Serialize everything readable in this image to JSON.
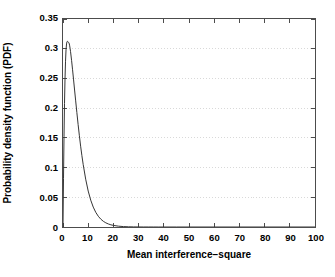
{
  "chart_data": {
    "type": "line",
    "title": "",
    "subtitle": "",
    "xlabel": "Mean interference−square",
    "ylabel": "Probability density function (PDF)",
    "xlim": [
      0,
      100
    ],
    "ylim": [
      0,
      0.35
    ],
    "xticks": [
      0,
      10,
      20,
      30,
      40,
      50,
      60,
      70,
      80,
      90,
      100
    ],
    "xtick_labels": [
      "0",
      "10",
      "20",
      "30",
      "40",
      "50",
      "60",
      "70",
      "80",
      "90",
      "100"
    ],
    "yticks": [
      0,
      0.05,
      0.1,
      0.15,
      0.2,
      0.25,
      0.3,
      0.35
    ],
    "ytick_labels": [
      "0",
      "0.05",
      "0.1",
      "0.15",
      "0.2",
      "0.25",
      "0.3",
      "0.35"
    ],
    "grid": {
      "horizontal": true,
      "vertical": false,
      "style": "dotted",
      "color": "#d9d9d9"
    },
    "legend": {
      "visible": false,
      "position": "none"
    },
    "box": true,
    "tick_direction": "in",
    "line_color": "#333333",
    "line_width": 1.0,
    "series": [
      {
        "name": "PDF of mean interference-square",
        "x": [
          0.0,
          0.2,
          0.4,
          0.6,
          0.8,
          1.0,
          1.2,
          1.4,
          1.6,
          1.8,
          2.0,
          2.2,
          2.3,
          2.4,
          2.6,
          2.8,
          3.0,
          3.4,
          3.8,
          4.2,
          4.6,
          5.0,
          5.5,
          6.0,
          6.5,
          7.0,
          7.5,
          8.0,
          9.0,
          10.0,
          11.0,
          12.0,
          13.0,
          14.0,
          15.0,
          16.0,
          17.0,
          18.0,
          19.0,
          20.0,
          22.0,
          24.0,
          26.0,
          28.0,
          30.0,
          32.0,
          34.0,
          36.0,
          38.0,
          40.0,
          45.0,
          50.0,
          60.0,
          70.0,
          80.0,
          90.0,
          100.0
        ],
        "y": [
          0.0,
          0.082,
          0.152,
          0.208,
          0.249,
          0.279,
          0.298,
          0.308,
          0.312,
          0.3125,
          0.3115,
          0.3105,
          0.3103,
          0.3095,
          0.306,
          0.301,
          0.295,
          0.2805,
          0.2645,
          0.2475,
          0.2305,
          0.2135,
          0.1925,
          0.1725,
          0.1535,
          0.136,
          0.12,
          0.1055,
          0.0805,
          0.0605,
          0.0452,
          0.0335,
          0.0247,
          0.0181,
          0.0132,
          0.0096,
          0.007,
          0.0051,
          0.0037,
          0.0027,
          0.0014,
          0.0007,
          0.00037,
          0.00019,
          0.0001,
          5e-05,
          2.6e-05,
          1.3e-05,
          7e-06,
          3.5e-06,
          6e-07,
          1e-07,
          0.0,
          0.0,
          0.0,
          0.0,
          0.0
        ]
      }
    ],
    "peak": {
      "x": 1.8,
      "y": 0.3125
    }
  }
}
